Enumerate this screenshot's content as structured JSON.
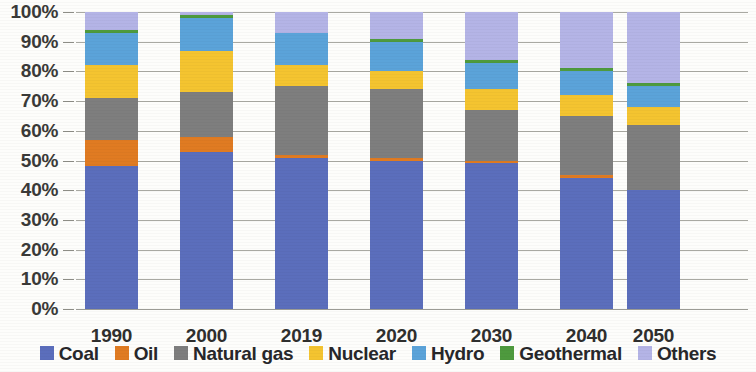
{
  "chart_data": {
    "type": "bar",
    "subtype": "stacked-100-percent",
    "title": "",
    "xlabel": "",
    "ylabel": "",
    "categories": [
      "1990",
      "2000",
      "2019",
      "2020",
      "2030",
      "2040",
      "2050"
    ],
    "ylim": [
      0,
      100
    ],
    "ytick_labels": [
      "0%",
      "10%",
      "20%",
      "30%",
      "40%",
      "50%",
      "60%",
      "70%",
      "80%",
      "90%",
      "100%"
    ],
    "ytick_values": [
      0,
      10,
      20,
      30,
      40,
      50,
      60,
      70,
      80,
      90,
      100
    ],
    "grid": true,
    "legend_position": "bottom",
    "series": [
      {
        "name": "Coal",
        "color": "#5b6ebc",
        "values": [
          48,
          53,
          51,
          50,
          49,
          44,
          40
        ]
      },
      {
        "name": "Oil",
        "color": "#e07b22",
        "values": [
          9,
          5,
          1,
          1,
          1,
          1,
          0
        ]
      },
      {
        "name": "Natural gas",
        "color": "#7e7e7e",
        "values": [
          14,
          15,
          23,
          23,
          17,
          20,
          22
        ]
      },
      {
        "name": "Nuclear",
        "color": "#f4c430",
        "values": [
          11,
          14,
          7,
          6,
          7,
          7,
          6
        ]
      },
      {
        "name": "Hydro",
        "color": "#5ba3d9",
        "values": [
          11,
          11,
          11,
          10,
          9,
          8,
          7
        ]
      },
      {
        "name": "Geothermal",
        "color": "#4e9a3e",
        "values": [
          1,
          1,
          0,
          1,
          1,
          1,
          1
        ]
      },
      {
        "name": "Others",
        "color": "#b4b4e6",
        "values": [
          6,
          1,
          7,
          9,
          16,
          19,
          24
        ]
      }
    ]
  },
  "legend": {
    "items": [
      {
        "label": "Coal",
        "color": "#5b6ebc"
      },
      {
        "label": "Oil",
        "color": "#e07b22"
      },
      {
        "label": "Natural gas",
        "color": "#7e7e7e"
      },
      {
        "label": "Nuclear",
        "color": "#f4c430"
      },
      {
        "label": "Hydro",
        "color": "#5ba3d9"
      },
      {
        "label": "Geothermal",
        "color": "#4e9a3e"
      },
      {
        "label": "Others",
        "color": "#b4b4e6"
      }
    ]
  }
}
